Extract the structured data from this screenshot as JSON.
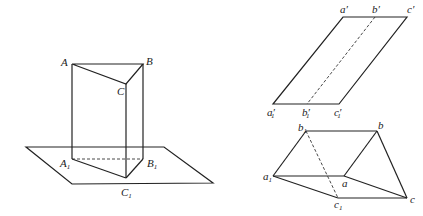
{
  "figure_left": {
    "title": "triangular prism standing on a plane",
    "labels": {
      "A": "A",
      "B": "B",
      "C": "C",
      "A1": "A",
      "B1": "B",
      "C1": "C",
      "sub1": "1"
    }
  },
  "figure_right_top": {
    "title": "parallelogram projection",
    "labels": {
      "a_prime": "a′",
      "b_prime": "b′",
      "c_prime": "c′",
      "a1_prime": "a′",
      "b1_prime": "b′",
      "c1_prime": "c′",
      "sub1": "1"
    }
  },
  "figure_right_bottom": {
    "title": "oblique prism",
    "labels": {
      "a": "a",
      "b": "b",
      "c": "c",
      "a1": "a",
      "b1": "b",
      "c1": "c",
      "sub1": "1"
    }
  },
  "colors": {
    "stroke": "#222222",
    "background": "#ffffff"
  }
}
